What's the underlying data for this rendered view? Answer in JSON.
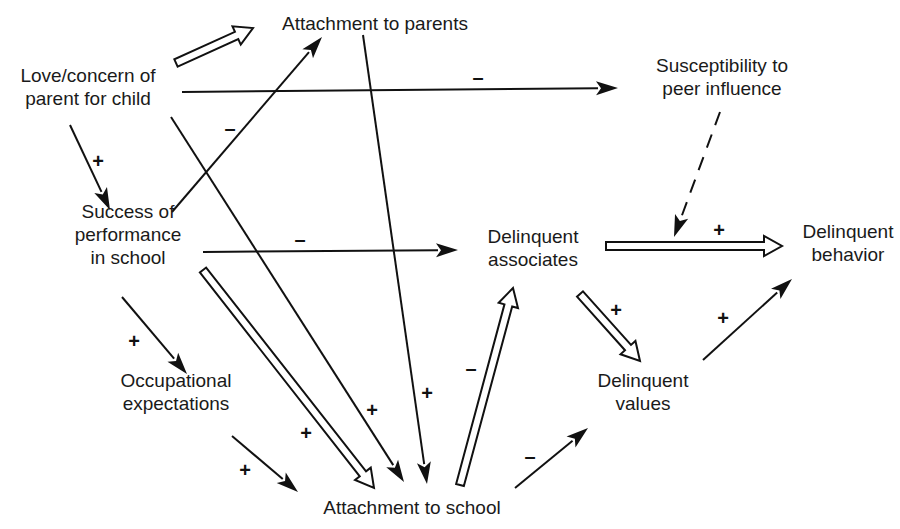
{
  "diagram": {
    "type": "causal path diagram",
    "nodes": [
      {
        "id": "love",
        "lines": [
          "Love/concern of",
          "parent for child"
        ],
        "x": 88,
        "y": 87
      },
      {
        "id": "attach_parents",
        "lines": [
          "Attachment to parents"
        ],
        "x": 375,
        "y": 24
      },
      {
        "id": "susceptibility",
        "lines": [
          "Susceptibility to",
          "peer influence"
        ],
        "x": 722,
        "y": 77
      },
      {
        "id": "success",
        "lines": [
          "Success of",
          "performance",
          "in school"
        ],
        "x": 128,
        "y": 235
      },
      {
        "id": "delinq_assoc",
        "lines": [
          "Delinquent",
          "associates"
        ],
        "x": 533,
        "y": 248
      },
      {
        "id": "delinq_behavior",
        "lines": [
          "Delinquent",
          "behavior"
        ],
        "x": 848,
        "y": 243
      },
      {
        "id": "occupational",
        "lines": [
          "Occupational",
          "expectations"
        ],
        "x": 176,
        "y": 392
      },
      {
        "id": "delinq_values",
        "lines": [
          "Delinquent",
          "values"
        ],
        "x": 643,
        "y": 392
      },
      {
        "id": "attach_school",
        "lines": [
          "Attachment to school"
        ],
        "x": 412,
        "y": 508
      }
    ],
    "edges": [
      {
        "from": "love",
        "to": "attach_parents",
        "style": "hollow",
        "sign": "",
        "x1": 176,
        "y1": 63,
        "x2": 253,
        "y2": 28
      },
      {
        "from": "love",
        "to": "susceptibility",
        "style": "solid",
        "sign": "–",
        "x1": 182,
        "y1": 92,
        "x2": 618,
        "y2": 88,
        "sx": 478,
        "sy": 79
      },
      {
        "from": "love",
        "to": "success",
        "style": "solid",
        "sign": "+",
        "x1": 70,
        "y1": 125,
        "x2": 110,
        "y2": 210,
        "sx": 98,
        "sy": 163
      },
      {
        "from": "love",
        "to": "attach_school",
        "style": "solid",
        "sign": "+",
        "x1": 171,
        "y1": 117,
        "x2": 404,
        "y2": 482,
        "sx": 372,
        "sy": 412
      },
      {
        "from": "success",
        "to": "attach_parents",
        "style": "solid",
        "sign": "–",
        "x1": 172,
        "y1": 212,
        "x2": 322,
        "y2": 37,
        "sx": 230,
        "sy": 130
      },
      {
        "from": "attach_parents",
        "to": "attach_school",
        "style": "solid",
        "sign": "+",
        "x1": 363,
        "y1": 35,
        "x2": 427,
        "y2": 484,
        "sx": 427,
        "sy": 395
      },
      {
        "from": "success",
        "to": "delinq_assoc",
        "style": "solid",
        "sign": "–",
        "x1": 203,
        "y1": 252,
        "x2": 458,
        "y2": 250,
        "sx": 300,
        "sy": 241
      },
      {
        "from": "success",
        "to": "occupational",
        "style": "solid",
        "sign": "+",
        "x1": 122,
        "y1": 297,
        "x2": 187,
        "y2": 374,
        "sx": 134,
        "sy": 343
      },
      {
        "from": "success",
        "to": "attach_school",
        "style": "hollow",
        "sign": "+",
        "x1": 203,
        "y1": 270,
        "x2": 374,
        "y2": 488,
        "sx": 306,
        "sy": 435
      },
      {
        "from": "occupational",
        "to": "attach_school",
        "style": "solid",
        "sign": "+",
        "x1": 232,
        "y1": 436,
        "x2": 298,
        "y2": 492,
        "sx": 245,
        "sy": 472
      },
      {
        "from": "attach_school",
        "to": "delinq_assoc",
        "style": "hollow",
        "sign": "–",
        "x1": 460,
        "y1": 485,
        "x2": 513,
        "y2": 288,
        "sx": 471,
        "sy": 370
      },
      {
        "from": "attach_school",
        "to": "delinq_values",
        "style": "solid",
        "sign": "–",
        "x1": 515,
        "y1": 488,
        "x2": 588,
        "y2": 428,
        "sx": 530,
        "sy": 458
      },
      {
        "from": "delinq_assoc",
        "to": "delinq_values",
        "style": "hollow",
        "sign": "+",
        "x1": 580,
        "y1": 294,
        "x2": 640,
        "y2": 361,
        "sx": 616,
        "sy": 312
      },
      {
        "from": "delinq_assoc",
        "to": "delinq_behavior",
        "style": "hollow",
        "sign": "+",
        "x1": 606,
        "y1": 246,
        "x2": 782,
        "y2": 246,
        "sx": 719,
        "sy": 232
      },
      {
        "from": "susceptibility",
        "to": "delinq_assoc_behavior_link",
        "style": "dashed",
        "sign": "",
        "x1": 720,
        "y1": 112,
        "x2": 674,
        "y2": 237
      },
      {
        "from": "delinq_values",
        "to": "delinq_behavior",
        "style": "solid",
        "sign": "+",
        "x1": 703,
        "y1": 360,
        "x2": 792,
        "y2": 279,
        "sx": 723,
        "sy": 320
      }
    ]
  },
  "colors": {
    "ink": "#111111",
    "background": "#ffffff"
  }
}
